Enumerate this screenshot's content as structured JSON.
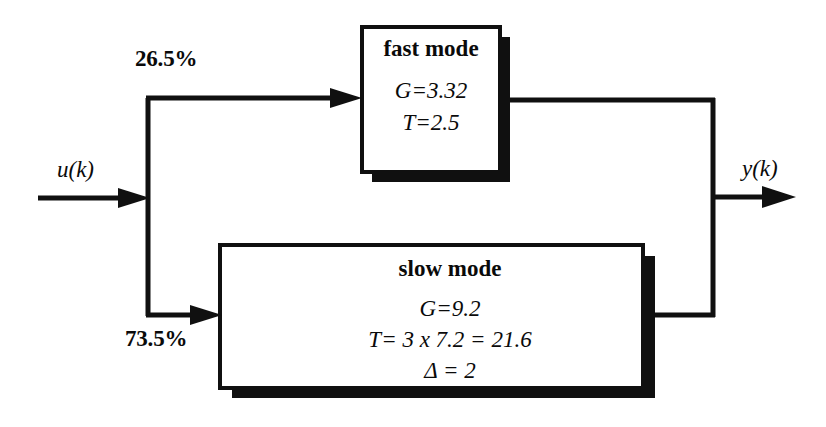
{
  "diagram": {
    "stroke_color": "#101010",
    "shadow_color": "#101010",
    "background": "#ffffff",
    "input": {
      "label": "u(k)",
      "arrow": "input-arrow"
    },
    "output": {
      "label": "y(k)",
      "arrow": "output-arrow"
    },
    "branches": [
      {
        "name": "fast-branch",
        "weight_label": "26.5%",
        "arrow": "fast-branch-arrow"
      },
      {
        "name": "slow-branch",
        "weight_label": "73.5%",
        "arrow": "slow-branch-arrow"
      }
    ],
    "blocks": [
      {
        "name": "fast-mode-block",
        "title": "fast  mode",
        "lines": [
          "G=3.32",
          "T=2.5"
        ]
      },
      {
        "name": "slow-mode-block",
        "title": "slow mode",
        "lines": [
          "G=9.2",
          "T= 3 x 7.2 = 21.6",
          "Δ = 2"
        ]
      }
    ]
  }
}
